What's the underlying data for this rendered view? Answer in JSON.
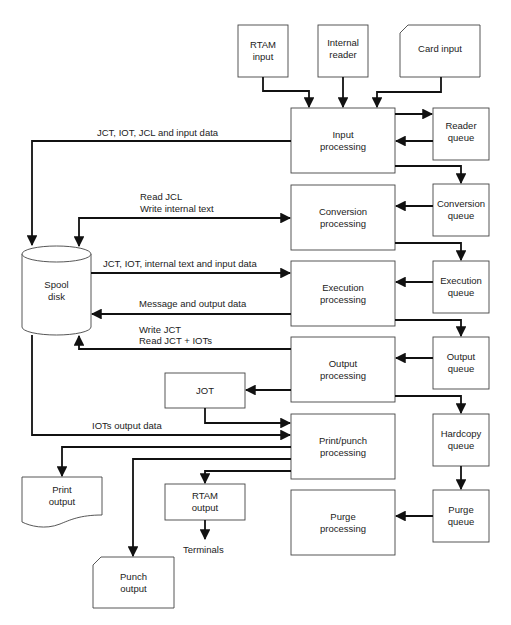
{
  "diagram": {
    "type": "flowchart",
    "nodes": {
      "rtam_input": {
        "label": "RTAM\ninput",
        "shape": "rect"
      },
      "internal_reader": {
        "label": "Internal\nreader",
        "shape": "rect"
      },
      "card_input": {
        "label": "Card input",
        "shape": "card"
      },
      "input_processing": {
        "label": "Input\nprocessing",
        "shape": "rect"
      },
      "reader_queue": {
        "label": "Reader\nqueue",
        "shape": "rect"
      },
      "conversion_processing": {
        "label": "Conversion\nprocessing",
        "shape": "rect"
      },
      "conversion_queue": {
        "label": "Conversion\nqueue",
        "shape": "rect"
      },
      "execution_processing": {
        "label": "Execution\nprocessing",
        "shape": "rect"
      },
      "execution_queue": {
        "label": "Execution\nqueue",
        "shape": "rect"
      },
      "output_processing": {
        "label": "Output\nprocessing",
        "shape": "rect"
      },
      "output_queue": {
        "label": "Output\nqueue",
        "shape": "rect"
      },
      "jot": {
        "label": "JOT",
        "shape": "rect"
      },
      "print_punch_processing": {
        "label": "Print/punch\nprocessing",
        "shape": "rect"
      },
      "hardcopy_queue": {
        "label": "Hardcopy\nqueue",
        "shape": "rect"
      },
      "purge_processing": {
        "label": "Purge\nprocessing",
        "shape": "rect"
      },
      "purge_queue": {
        "label": "Purge\nqueue",
        "shape": "rect"
      },
      "rtam_output": {
        "label": "RTAM\noutput",
        "shape": "rect"
      },
      "print_output": {
        "label": "Print\noutput",
        "shape": "document"
      },
      "punch_output": {
        "label": "Punch\noutput",
        "shape": "card"
      },
      "spool_disk": {
        "label": "Spool\ndisk",
        "shape": "cylinder"
      }
    },
    "edge_labels": {
      "input_to_spool": "JCT, IOT, JCL and input data",
      "conversion_read": "Read JCL",
      "conversion_write": "Write internal text",
      "spool_to_execution": "JCT, IOT, internal text and input data",
      "execution_to_spool": "Message and output data",
      "output_write": "Write JCT",
      "output_read": "Read JCT + IOTs",
      "spool_to_print": "IOTs output data",
      "terminals": "Terminals"
    },
    "edges": [
      {
        "from": "rtam_input",
        "to": "input_processing"
      },
      {
        "from": "internal_reader",
        "to": "input_processing"
      },
      {
        "from": "card_input",
        "to": "input_processing"
      },
      {
        "from": "input_processing",
        "to": "reader_queue"
      },
      {
        "from": "reader_queue",
        "to": "input_processing"
      },
      {
        "from": "input_processing",
        "to": "conversion_queue"
      },
      {
        "from": "input_processing",
        "to": "spool_disk",
        "label": "JCT, IOT, JCL and input data"
      },
      {
        "from": "conversion_queue",
        "to": "conversion_processing"
      },
      {
        "from": "spool_disk",
        "to": "conversion_processing",
        "label": "Read JCL / Write internal text",
        "bidirectional": true
      },
      {
        "from": "conversion_processing",
        "to": "execution_queue"
      },
      {
        "from": "execution_queue",
        "to": "execution_processing"
      },
      {
        "from": "spool_disk",
        "to": "execution_processing",
        "label": "JCT, IOT, internal text and input data"
      },
      {
        "from": "execution_processing",
        "to": "spool_disk",
        "label": "Message and output data"
      },
      {
        "from": "execution_processing",
        "to": "output_queue"
      },
      {
        "from": "output_queue",
        "to": "output_processing"
      },
      {
        "from": "output_processing",
        "to": "spool_disk",
        "label": "Write JCT / Read JCT + IOTs"
      },
      {
        "from": "output_processing",
        "to": "jot"
      },
      {
        "from": "output_processing",
        "to": "hardcopy_queue"
      },
      {
        "from": "jot",
        "to": "print_punch_processing"
      },
      {
        "from": "spool_disk",
        "to": "print_punch_processing",
        "label": "IOTs output data"
      },
      {
        "from": "print_punch_processing",
        "to": "print_output"
      },
      {
        "from": "print_punch_processing",
        "to": "punch_output"
      },
      {
        "from": "print_punch_processing",
        "to": "rtam_output"
      },
      {
        "from": "rtam_output",
        "to": "terminals"
      },
      {
        "from": "hardcopy_queue",
        "to": "purge_queue"
      },
      {
        "from": "purge_queue",
        "to": "purge_processing"
      }
    ]
  }
}
